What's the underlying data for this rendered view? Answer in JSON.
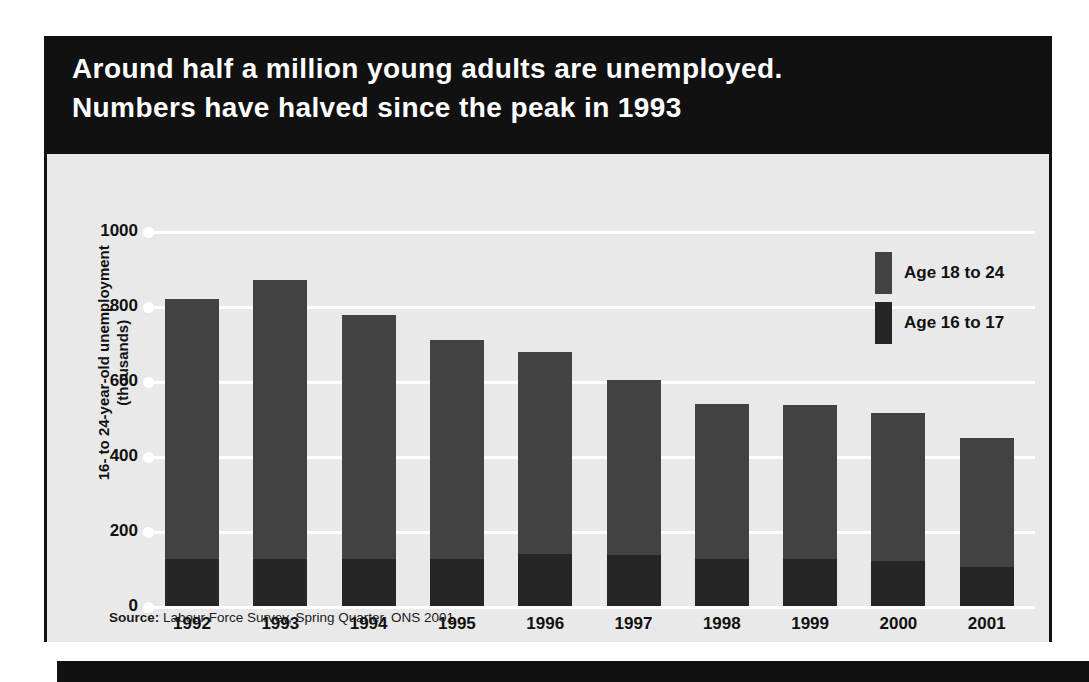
{
  "headline": {
    "line1": "Around half a million young adults are unemployed.",
    "line2": "Numbers have halved since the peak in 1993"
  },
  "source": {
    "label": "Source:",
    "text": " Labour Force Survey, Spring Quarter, ONS 2001"
  },
  "colors": {
    "background": "#e9e9e9",
    "header_bg": "#111111",
    "header_text": "#ffffff",
    "age_18_24": "#424242",
    "age_16_17": "#262626",
    "gridline": "#ffffff"
  },
  "chart_data": {
    "type": "bar",
    "subtype": "stacked-vertical",
    "title": "Around half a million young adults are unemployed. Numbers have halved since the peak in 1993",
    "xlabel": "",
    "ylabel": "16- to 24-year-old unemployment (thousands)",
    "ylabel_line1": "16- to 24-year-old unemployment",
    "ylabel_line2": "(thousands)",
    "ylim": [
      0,
      1000
    ],
    "yticks": [
      0,
      200,
      400,
      600,
      800,
      1000
    ],
    "ytick_labels": [
      "0",
      "200",
      "400",
      "600",
      "800",
      "1000"
    ],
    "grid": true,
    "legend_position": "top-right",
    "categories": [
      "1992",
      "1993",
      "1994",
      "1995",
      "1996",
      "1997",
      "1998",
      "1999",
      "2000",
      "2001"
    ],
    "series": [
      {
        "name": "Age 16 to 17",
        "color": "#262626",
        "values": [
          125,
          125,
          125,
          125,
          138,
          135,
          125,
          125,
          120,
          105
        ]
      },
      {
        "name": "Age 18 to 24",
        "color": "#424242",
        "values": [
          695,
          745,
          650,
          585,
          540,
          468,
          415,
          412,
          395,
          342
        ]
      }
    ],
    "totals": [
      820,
      870,
      775,
      710,
      678,
      603,
      540,
      537,
      515,
      447
    ],
    "annotations": [],
    "source": "Source: Labour Force Survey, Spring Quarter, ONS 2001"
  },
  "legend": {
    "items": [
      {
        "label": "Age 18 to 24",
        "color": "#424242"
      },
      {
        "label": "Age 16 to 17",
        "color": "#262626"
      }
    ]
  }
}
